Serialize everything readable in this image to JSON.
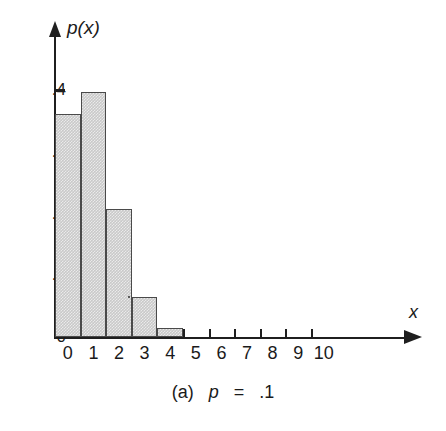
{
  "figure": {
    "caption_prefix": "(a)",
    "caption_param": "p",
    "caption_eq": "=",
    "caption_value": ".1"
  },
  "axes": {
    "y_title": "p(x)",
    "x_title": "x",
    "y_ticks": [
      "0",
      ".1",
      ".2",
      ".3",
      ".4"
    ],
    "x_ticks": [
      "0",
      "1",
      "2",
      "3",
      "4",
      "5",
      "6",
      "7",
      "8",
      "9",
      "10"
    ]
  },
  "style": {
    "bar_fill": "#c9c9c9",
    "bar_stroke": "#4a4a4a",
    "axis_color": "#1f1f1f",
    "background": "#ffffff"
  },
  "chart_data": {
    "type": "bar",
    "title": "",
    "subtitle": "",
    "xlabel": "x",
    "ylabel": "p(x)",
    "categories": [
      "0",
      "1",
      "2",
      "3",
      "4",
      "5",
      "6",
      "7",
      "8",
      "9",
      "10"
    ],
    "values": [
      0.361,
      0.396,
      0.207,
      0.065,
      0.014,
      0.0,
      0.0,
      0.0,
      0.0,
      0.0,
      0.0
    ],
    "series": [
      {
        "name": "p(x)",
        "values": [
          0.361,
          0.396,
          0.207,
          0.065,
          0.014,
          0.0,
          0.0,
          0.0,
          0.0,
          0.0,
          0.0
        ]
      }
    ],
    "xlim": [
      -0.5,
      10.5
    ],
    "ylim": [
      0,
      0.44
    ],
    "ytick_values": [
      0,
      0.1,
      0.2,
      0.3,
      0.4
    ],
    "ytick_labels": [
      "0",
      ".1",
      ".2",
      ".3",
      ".4"
    ],
    "xtick_values": [
      0,
      1,
      2,
      3,
      4,
      5,
      6,
      7,
      8,
      9,
      10
    ],
    "grid": false,
    "legend": "none",
    "annotations": [
      "(a) p = .1"
    ]
  }
}
